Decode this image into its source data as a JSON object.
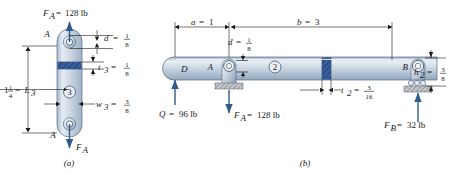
{
  "figure": {
    "title_semantic": "two-part mechanical link and beam free-body diagram",
    "panels": [
      {
        "caption": "(a)",
        "name": "link-member-3",
        "member_label": "3",
        "points": {
          "top": "A",
          "bottom": "A"
        },
        "forces": [
          {
            "name": "F_A-top",
            "symbol": "F",
            "subscript": "A",
            "equals": "=",
            "value": "128 lb",
            "direction": "up"
          },
          {
            "name": "F_A-bottom",
            "symbol": "F",
            "subscript": "A",
            "equals": "",
            "value": "",
            "direction": "down"
          }
        ],
        "dimensions": [
          {
            "name": "L3",
            "lhs_whole": "1",
            "lhs_num": "1",
            "lhs_den": "4",
            "equals": "=",
            "symbol": "L",
            "subscript": "3"
          },
          {
            "name": "d",
            "symbol": "d",
            "subscript": "",
            "equals": "=",
            "num": "1",
            "den": "8"
          },
          {
            "name": "t3",
            "symbol": "t",
            "subscript": "3",
            "equals": "=",
            "num": "1",
            "den": "8"
          },
          {
            "name": "w3",
            "symbol": "w",
            "subscript": "3",
            "equals": "=",
            "num": "3",
            "den": "8"
          }
        ]
      },
      {
        "caption": "(b)",
        "name": "beam-member-2",
        "member_label": "2",
        "points": {
          "left_end": "D",
          "pin": "A",
          "roller": "B"
        },
        "forces": [
          {
            "name": "Q",
            "symbol": "Q",
            "subscript": "",
            "equals": "=",
            "value": "96 lb",
            "direction": "up"
          },
          {
            "name": "F_A",
            "symbol": "F",
            "subscript": "A",
            "equals": "=",
            "value": "128 lb",
            "direction": "down"
          },
          {
            "name": "F_B",
            "symbol": "F",
            "subscript": "B",
            "equals": "=",
            "value": "32 lb",
            "direction": "up"
          }
        ],
        "dimensions": [
          {
            "name": "a",
            "symbol": "a",
            "subscript": "",
            "equals": "=",
            "value": "1"
          },
          {
            "name": "b",
            "symbol": "b",
            "subscript": "",
            "equals": "=",
            "value": "3"
          },
          {
            "name": "d",
            "symbol": "d",
            "subscript": "",
            "equals": "=",
            "num": "1",
            "den": "8"
          },
          {
            "name": "t2",
            "symbol": "t",
            "subscript": "2",
            "equals": "=",
            "num": "3",
            "den": "16"
          },
          {
            "name": "h2",
            "symbol": "h",
            "subscript": "2",
            "equals": "=",
            "num": "3",
            "den": "8"
          }
        ]
      }
    ],
    "colors": {
      "force_arrow": "#2e5b8c",
      "body_light": "#dfe6ee",
      "body_mid": "#b8c6d6",
      "body_dark": "#8fa3ba",
      "section_hatch": "#2f4f86",
      "support_hatch": "#b9bcc2",
      "line": "#1a1a1a"
    }
  }
}
